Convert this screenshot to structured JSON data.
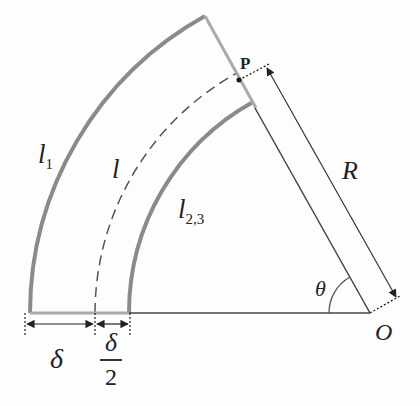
{
  "diagram": {
    "labels": {
      "outer_arc": "l",
      "outer_arc_sub": "1",
      "mid_arc": "l",
      "inner_arc": "l",
      "inner_arc_sub": "2,3",
      "radius": "R",
      "point": "P",
      "angle": "θ",
      "origin": "O",
      "thickness": "δ",
      "half_thickness_num": "δ",
      "half_thickness_den": "2"
    },
    "geometry": {
      "origin_px": [
        370,
        313
      ],
      "outer_radius_px": 340,
      "mid_radius_px": 275,
      "inner_radius_px": 241,
      "sector_angle_deg": 61
    },
    "colors": {
      "arc": "#8a8a8a",
      "line": "#333333",
      "background": "#fdfdfd"
    }
  }
}
